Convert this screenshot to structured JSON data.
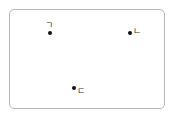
{
  "points": [
    {
      "label": "ㄱ",
      "x": 50,
      "y": 33,
      "label_x": 46,
      "label_y": 21
    },
    {
      "label": "ㄴ",
      "x": 130,
      "y": 33,
      "label_x": 134,
      "label_y": 27
    },
    {
      "label": "ㄷ",
      "x": 74,
      "y": 88,
      "label_x": 78,
      "label_y": 87
    }
  ],
  "colors": {
    "border": "#b8b8b8",
    "dot": "#111111",
    "text": "#333333"
  }
}
